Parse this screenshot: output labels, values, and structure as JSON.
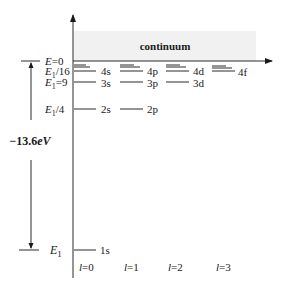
{
  "diagram": {
    "continuum_label": "continuum",
    "energy_span_label": "−13.6eV",
    "energy_span_label_parts": {
      "value": "−13.6",
      "unit": "eV"
    },
    "left_labels": {
      "e0": {
        "base": "E",
        "suffix": "=0"
      },
      "e4": {
        "base": "E",
        "sub": "1",
        "suffix": "/16"
      },
      "e3": {
        "base": "E",
        "sub": "1",
        "suffix": "=9"
      },
      "e2": {
        "base": "E",
        "sub": "1",
        "suffix": "/4"
      },
      "e1": {
        "base": "E",
        "sub": "1",
        "suffix": ""
      }
    },
    "levels": {
      "1s": "1s",
      "2s": "2s",
      "2p": "2p",
      "3s": "3s",
      "3p": "3p",
      "3d": "3d",
      "4s": "4s",
      "4p": "4p",
      "4d": "4d",
      "4f": "4f"
    },
    "l_labels": [
      {
        "var": "l",
        "eq": "=0"
      },
      {
        "var": "l",
        "eq": "=1"
      },
      {
        "var": "l",
        "eq": "=2"
      },
      {
        "var": "l",
        "eq": "=3"
      }
    ],
    "colors": {
      "continuum_fill": "#f1f1f1",
      "line": "#2a2a2a",
      "text": "#1a1a1a"
    }
  }
}
